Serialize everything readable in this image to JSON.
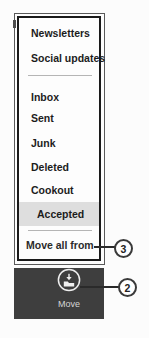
{
  "menu": {
    "items": [
      {
        "label": "Newsletters"
      },
      {
        "label": "Social updates"
      },
      {
        "label": "Inbox"
      },
      {
        "label": "Sent"
      },
      {
        "label": "Junk"
      },
      {
        "label": "Deleted"
      },
      {
        "label": "Cookout"
      },
      {
        "label": "Accepted",
        "state": "selected"
      }
    ],
    "footer_item": {
      "label": "Move all from"
    }
  },
  "app_bar": {
    "move_button": {
      "label": "Move",
      "icon": "move-to-folder-icon"
    }
  },
  "callouts": {
    "move_all_from_number": "3",
    "move_button_number": "2"
  },
  "colors": {
    "app_bar_bg": "#3e3e3e",
    "selected_item_bg": "#dedede",
    "menu_border": "#1a1a1a",
    "frame_border": "#5a5a5a",
    "item_text": "#1c1c1c",
    "move_label_text": "#d5d5d5",
    "callout_border": "#3a3a3a"
  }
}
